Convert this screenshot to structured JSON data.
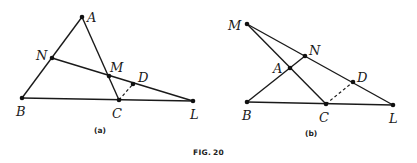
{
  "figure": {
    "caption_prefix": "FIG.",
    "caption_number": "20"
  },
  "panel_a": {
    "caption": "(a)",
    "points": {
      "A": {
        "label": "A",
        "x": 82,
        "y": 17
      },
      "N": {
        "label": "N",
        "x": 52,
        "y": 58
      },
      "M": {
        "label": "M",
        "x": 109,
        "y": 76
      },
      "D": {
        "label": "D",
        "x": 133,
        "y": 84
      },
      "B": {
        "label": "B",
        "x": 22,
        "y": 98
      },
      "C": {
        "label": "C",
        "x": 119,
        "y": 100
      },
      "L": {
        "label": "L",
        "x": 193,
        "y": 101
      }
    },
    "solid_segments": [
      [
        "A",
        "B"
      ],
      [
        "A",
        "C"
      ],
      [
        "B",
        "L"
      ],
      [
        "N",
        "L"
      ]
    ],
    "dashed_segments": [
      [
        "C",
        "D"
      ]
    ]
  },
  "panel_b": {
    "caption": "(b)",
    "points": {
      "M": {
        "label": "M",
        "x": 247,
        "y": 24
      },
      "N": {
        "label": "N",
        "x": 305,
        "y": 56
      },
      "A": {
        "label": "A",
        "x": 290,
        "y": 68
      },
      "D": {
        "label": "D",
        "x": 353,
        "y": 82
      },
      "B": {
        "label": "B",
        "x": 247,
        "y": 102
      },
      "C": {
        "label": "C",
        "x": 326,
        "y": 104
      },
      "L": {
        "label": "L",
        "x": 393,
        "y": 105
      }
    },
    "solid_segments": [
      [
        "M",
        "L"
      ],
      [
        "M",
        "C"
      ],
      [
        "B",
        "N"
      ],
      [
        "B",
        "L"
      ]
    ],
    "dashed_segments": [
      [
        "C",
        "D"
      ]
    ]
  },
  "colors": {
    "ink": "#1a1a1a",
    "background": "#ffffff"
  }
}
